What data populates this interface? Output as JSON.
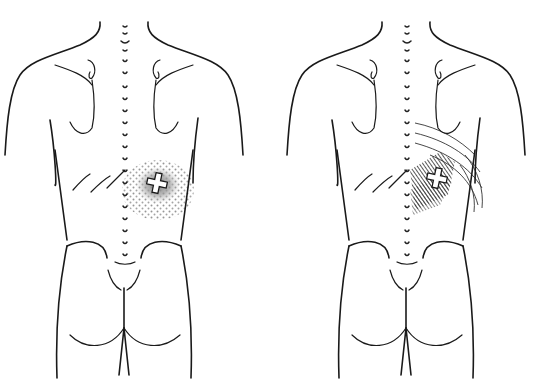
{
  "figures": [
    {
      "id": "left",
      "view": "posterior-torso",
      "spine_x": 125,
      "trigger_point": {
        "x": 157,
        "y": 183,
        "marker": "cross"
      },
      "referral_pattern": "stippled",
      "referral_color": "#8a8a8a"
    },
    {
      "id": "right",
      "view": "posterior-torso",
      "spine_x": 407,
      "trigger_point": {
        "x": 437,
        "y": 178,
        "marker": "cross"
      },
      "referral_pattern": "hatched",
      "referral_color": "#3a3a3a"
    }
  ],
  "colors": {
    "background": "#ffffff",
    "line": "#1a1a1a",
    "stipple": "#8a8a8a",
    "hatch_dark": "#3a3a3a"
  }
}
